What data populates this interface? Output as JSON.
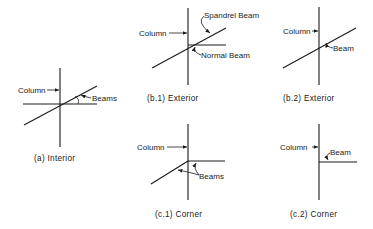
{
  "diagram": {
    "panels": [
      {
        "id": "a",
        "caption": "(a) Interior",
        "labels": {
          "column": "Column",
          "beam": "Beams"
        }
      },
      {
        "id": "b1",
        "caption": "(b.1) Exterior",
        "labels": {
          "column": "Column",
          "spandrel": "Spandrel Beam",
          "normal": "Normal Beam"
        }
      },
      {
        "id": "b2",
        "caption": "(b.2) Exterior",
        "labels": {
          "column": "Column",
          "beam": "Beam"
        }
      },
      {
        "id": "c1",
        "caption": "(c.1) Corner",
        "labels": {
          "column": "Column",
          "beam": "Beams"
        }
      },
      {
        "id": "c2",
        "caption": "(c.2) Corner",
        "labels": {
          "column": "Column",
          "beam": "Beam"
        }
      }
    ],
    "colors": {
      "ink": "#1a1a1a",
      "background": "#ffffff"
    }
  }
}
